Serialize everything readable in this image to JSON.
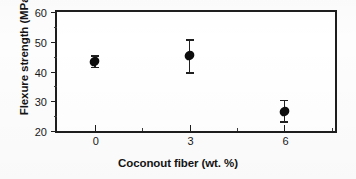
{
  "chart_data": {
    "type": "scatter",
    "title": "",
    "xlabel": "Coconout fiber (wt. %)",
    "ylabel": "Flexure strength (MPa)",
    "xlim": [
      -1.2,
      7.6
    ],
    "ylim": [
      20,
      60
    ],
    "grid": false,
    "legend": "none",
    "x_ticks": [
      {
        "value": 0,
        "label": "0"
      },
      {
        "value": 3,
        "label": "3"
      },
      {
        "value": 6,
        "label": "6"
      }
    ],
    "x_minor_ticks": [
      1.5,
      4.5,
      7.5
    ],
    "y_ticks": [
      {
        "value": 20,
        "label": "20"
      },
      {
        "value": 30,
        "label": "30"
      },
      {
        "value": 40,
        "label": "40"
      },
      {
        "value": 50,
        "label": "50"
      },
      {
        "value": 60,
        "label": "60"
      }
    ],
    "y_minor_ticks": [
      25,
      35,
      45,
      55
    ],
    "x": [
      0,
      3,
      6
    ],
    "values": [
      43.5,
      45.5,
      26.5
    ],
    "error_low": [
      2.0,
      5.8,
      3.2
    ],
    "error_high": [
      2.0,
      5.3,
      4.0
    ],
    "marker": "filled-diamond",
    "marker_color": "#0d0d0d",
    "points": [
      {
        "x": 0,
        "y": 43.5,
        "err_low": 2.0,
        "err_high": 2.0
      },
      {
        "x": 3,
        "y": 45.5,
        "err_low": 5.8,
        "err_high": 5.3
      },
      {
        "x": 6,
        "y": 26.5,
        "err_low": 3.2,
        "err_high": 4.0
      }
    ]
  }
}
